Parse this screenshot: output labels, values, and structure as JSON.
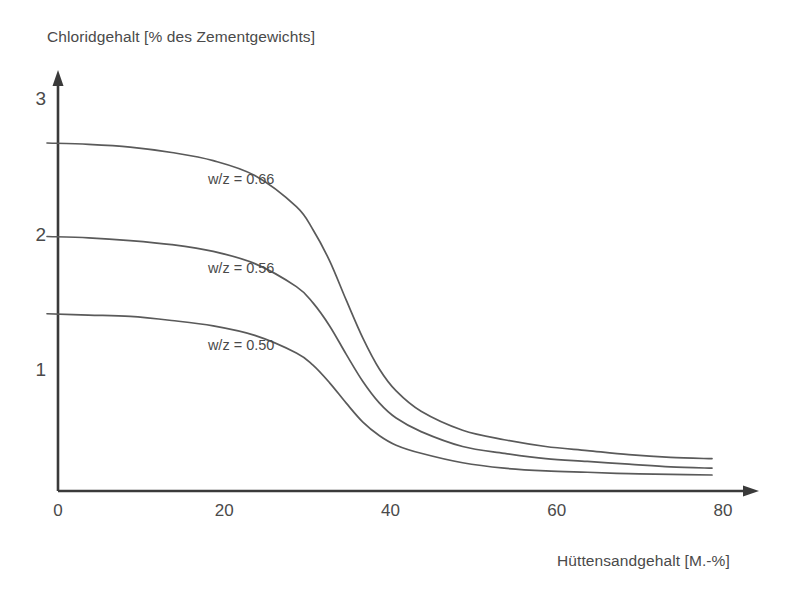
{
  "chart_data": {
    "type": "line",
    "title": "",
    "subtitle": "",
    "ylabel": "Chloridgehalt [% des Zementgewichts]",
    "xlabel": "Hüttensandgehalt  [M.-%]",
    "xlim": [
      0,
      84
    ],
    "ylim": [
      0,
      3.2
    ],
    "xticks": [
      0,
      20,
      40,
      60,
      80
    ],
    "xtick_labels": [
      "0",
      "20",
      "40",
      "60",
      "80"
    ],
    "yticks": [
      1,
      2,
      3
    ],
    "ytick_labels": [
      "1",
      "2",
      "3"
    ],
    "grid": false,
    "legend_position": "inline-annotations",
    "line_color": "#5a5a5a",
    "axis_color": "#3a3a3a",
    "x": [
      0,
      5,
      10,
      15,
      20,
      25,
      30,
      32,
      34,
      36,
      38,
      40,
      42,
      45,
      50,
      55,
      60,
      65,
      70,
      75,
      80
    ],
    "series": [
      {
        "name": "w/z = 0.66",
        "label": "w/z = 0.66",
        "values": [
          2.69,
          2.68,
          2.66,
          2.62,
          2.56,
          2.45,
          2.22,
          2.05,
          1.82,
          1.53,
          1.25,
          1.02,
          0.86,
          0.71,
          0.57,
          0.5,
          0.45,
          0.42,
          0.39,
          0.37,
          0.36
        ],
        "label_x": 22,
        "label_y_value": 2.42
      },
      {
        "name": "w/z = 0.56",
        "label": "w/z = 0.56",
        "values": [
          2.0,
          1.99,
          1.97,
          1.94,
          1.89,
          1.8,
          1.63,
          1.51,
          1.34,
          1.13,
          0.93,
          0.77,
          0.66,
          0.56,
          0.45,
          0.4,
          0.36,
          0.34,
          0.32,
          0.3,
          0.29
        ],
        "label_x": 22,
        "label_y_value": 1.76
      },
      {
        "name": "w/z = 0.50",
        "label": "w/z = 0.50",
        "values": [
          1.43,
          1.42,
          1.41,
          1.38,
          1.34,
          1.27,
          1.14,
          1.05,
          0.92,
          0.77,
          0.63,
          0.53,
          0.46,
          0.4,
          0.33,
          0.29,
          0.27,
          0.26,
          0.25,
          0.245,
          0.24
        ],
        "label_x": 22,
        "label_y_value": 1.19
      }
    ]
  },
  "axes": {
    "y_axis_name": "chloride-content-axis",
    "x_axis_name": "slag-content-axis"
  }
}
